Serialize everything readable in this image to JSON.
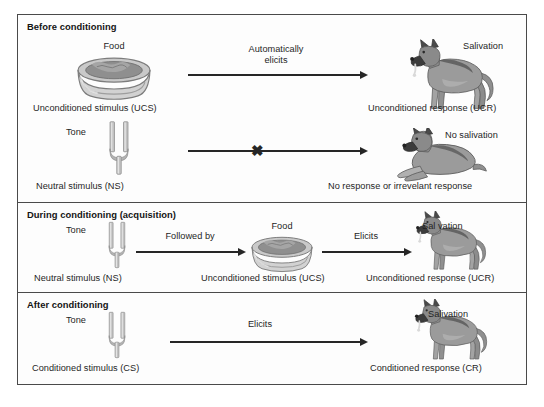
{
  "figure": {
    "panels": [
      {
        "id": "before",
        "title": "Before conditioning",
        "rows": [
          {
            "stimulus_top_label": "Food",
            "stimulus_icon": "food-bowl-icon",
            "stimulus_caption": "Unconditioned stimulus (UCS)",
            "arrow_label_line1": "Automatically",
            "arrow_label_line2": "elicits",
            "arrow_blocked": false,
            "response_icon": "dog-standing-icon",
            "response_top_label": "Salivation",
            "response_caption": "Unconditioned response (UCR)"
          },
          {
            "stimulus_top_label": "Tone",
            "stimulus_icon": "tuning-fork-icon",
            "stimulus_caption": "Neutral stimulus (NS)",
            "arrow_label_line1": "",
            "arrow_label_line2": "",
            "arrow_blocked": true,
            "block_marker": "✖",
            "response_icon": "dog-lying-icon",
            "response_top_label": "No salivation",
            "response_caption": "No response or irrevelant response"
          }
        ]
      },
      {
        "id": "during",
        "title": "During conditioning (acquisition)",
        "rows": [
          {
            "stimulus_top_label": "Tone",
            "stimulus_icon": "tuning-fork-icon",
            "stimulus_caption": "Neutral stimulus (NS)",
            "arrow_label_line1": "Followed by",
            "arrow_label_line2": "",
            "arrow_blocked": false,
            "middle_top_label": "Food",
            "middle_icon": "food-bowl-icon",
            "middle_caption": "Unconditioned stimulus (UCS)",
            "arrow2_label": "Elicits",
            "response_icon": "dog-standing-icon",
            "response_top_label": "Sal vation",
            "response_caption": "Unconditioned response (UCR)"
          }
        ]
      },
      {
        "id": "after",
        "title": "After conditioning",
        "rows": [
          {
            "stimulus_top_label": "Tone",
            "stimulus_icon": "tuning-fork-icon",
            "stimulus_caption": "Conditioned stimulus (CS)",
            "arrow_label_line1": "Elicits",
            "arrow_label_line2": "",
            "arrow_blocked": false,
            "response_icon": "dog-standing-icon",
            "response_top_label": "Salivation",
            "response_caption": "Conditioned response (CR)"
          }
        ]
      }
    ]
  },
  "colors": {
    "border": "#4a4a4a",
    "text": "#1f1f1f",
    "arrow": "#262626",
    "bowl_light": "#d8d8d8",
    "bowl_dark": "#9a9a9a",
    "fork_gray": "#b8b8b8",
    "dog_body": "#8c8c8c",
    "dog_dark": "#3f3f3f"
  }
}
